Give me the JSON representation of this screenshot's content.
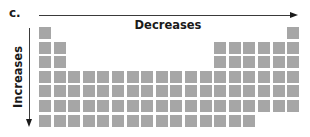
{
  "figure": {
    "panel_label": "c.",
    "horizontal_axis": {
      "label": "Decreases",
      "direction": "left-to-right"
    },
    "vertical_axis": {
      "label": "Increases",
      "direction": "top-to-bottom"
    },
    "cell_color": "#a6a6a6",
    "arrow_color": "#1a1a1a"
  },
  "grid": {
    "columns": 18,
    "rows": 7,
    "pitch_px": 14.6,
    "cell_px": 12,
    "layout": [
      [
        1,
        0,
        0,
        0,
        0,
        0,
        0,
        0,
        0,
        0,
        0,
        0,
        0,
        0,
        0,
        0,
        0,
        1
      ],
      [
        1,
        1,
        0,
        0,
        0,
        0,
        0,
        0,
        0,
        0,
        0,
        0,
        1,
        1,
        1,
        1,
        1,
        1
      ],
      [
        1,
        1,
        0,
        0,
        0,
        0,
        0,
        0,
        0,
        0,
        0,
        0,
        1,
        1,
        1,
        1,
        1,
        1
      ],
      [
        1,
        1,
        1,
        1,
        1,
        1,
        1,
        1,
        1,
        1,
        1,
        1,
        1,
        1,
        1,
        1,
        1,
        1
      ],
      [
        1,
        1,
        1,
        1,
        1,
        1,
        1,
        1,
        1,
        1,
        1,
        1,
        1,
        1,
        1,
        1,
        1,
        1
      ],
      [
        1,
        1,
        1,
        1,
        1,
        1,
        1,
        1,
        1,
        1,
        1,
        1,
        1,
        1,
        1,
        1,
        1,
        1
      ],
      [
        1,
        1,
        1,
        1,
        1,
        1,
        1,
        1,
        1,
        1,
        1,
        1,
        1,
        1,
        1,
        0,
        0,
        0
      ]
    ]
  }
}
